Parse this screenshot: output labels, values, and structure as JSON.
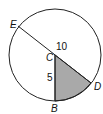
{
  "diagram": {
    "type": "circle-sector",
    "labels": {
      "E": "E",
      "C": "C",
      "D": "D",
      "B": "B",
      "segment_top": "10",
      "segment_cb": "5"
    },
    "colors": {
      "stroke": "#222222",
      "shaded_sector": "#a9a9a9",
      "background": "#ffffff"
    }
  }
}
